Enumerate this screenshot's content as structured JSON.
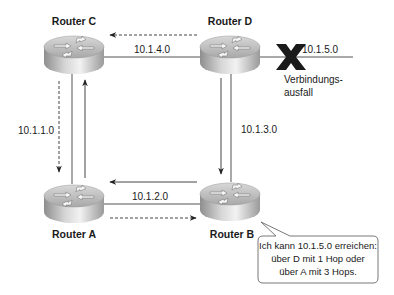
{
  "routers": {
    "a": {
      "label": "Router A"
    },
    "b": {
      "label": "Router B"
    },
    "c": {
      "label": "Router C"
    },
    "d": {
      "label": "Router D"
    }
  },
  "networks": {
    "c_d": "10.1.4.0",
    "d_ext": "10.1.5.0",
    "c_a": "10.1.1.0",
    "d_b": "10.1.3.0",
    "a_b": "10.1.2.0"
  },
  "failure": {
    "icon": "x-mark-icon",
    "label_line1": "Verbindungs-",
    "label_line2": "ausfall"
  },
  "callout": {
    "line1": "Ich kann 10.1.5.0 erreichen:",
    "line2": "über D mit 1 Hop oder",
    "line3": "über A mit 3 Hops."
  },
  "colors": {
    "line": "#4a4a4a",
    "router_top": "#c8c8c8",
    "router_side": "#a0a0a0",
    "x_mark": "#1a1a1a"
  }
}
